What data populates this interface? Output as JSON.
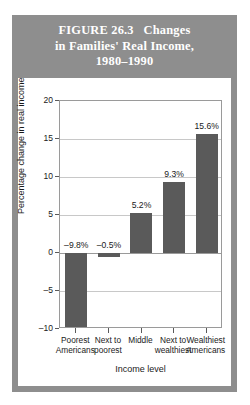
{
  "figure": {
    "title_line1": "FIGURE 26.3   Changes",
    "title_line2": "in Families' Real Income,",
    "title_line3": "1980–1990",
    "header_color": "#8e8e8e",
    "title_color": "#ffffff",
    "card_background": "#ffffff"
  },
  "chart_data": {
    "type": "bar",
    "title": "FIGURE 26.3 Changes in Families' Real Income, 1980–1990",
    "xlabel": "Income level",
    "ylabel": "Percentage change in real income",
    "categories": [
      "Poorest\nAmericans",
      "Next to\npoorest",
      "Middle",
      "Next to\nwealthiest",
      "Wealthiest\nAmericans"
    ],
    "category_lines": [
      [
        "Poorest",
        "Americans"
      ],
      [
        "Next to",
        "poorest"
      ],
      [
        "Middle",
        ""
      ],
      [
        "Next to",
        "wealthiest"
      ],
      [
        "Wealthiest",
        "Americans"
      ]
    ],
    "values": [
      -9.8,
      -0.5,
      5.2,
      9.3,
      15.6
    ],
    "data_labels": [
      "–9.8%",
      "–0.5%",
      "5.2%",
      "9.3%",
      "15.6%"
    ],
    "ylim": [
      -10,
      20
    ],
    "yticks": [
      20,
      15,
      10,
      5,
      0,
      -5,
      -10
    ],
    "ytick_labels": [
      "20",
      "15",
      "10",
      "5",
      "0",
      "–5",
      "–10"
    ],
    "grid": true,
    "legend": "none",
    "bar_color": "#5a5a5a",
    "gridline_color": "#c8c8c8",
    "axis_color": "#9a9a9a"
  }
}
